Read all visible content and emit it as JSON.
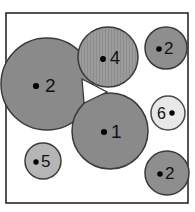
{
  "figure": {
    "background_color": "#ffffff",
    "frame": {
      "x": 6,
      "y": 13,
      "width": 182,
      "height": 190,
      "stroke_color": "#2a2a2a",
      "fill_color": "#ffffff"
    }
  },
  "chart_data": {
    "type": "scatter",
    "title": "",
    "xlabel": "",
    "ylabel": "",
    "grid": false,
    "legend": null,
    "xlim": [
      6,
      188
    ],
    "ylim": [
      13,
      203
    ],
    "categories": [
      "2",
      "4",
      "2",
      "1",
      "6",
      "5",
      "2"
    ],
    "values": [
      46,
      30,
      21,
      38,
      17,
      18,
      22
    ],
    "points": [
      {
        "label": "2",
        "name": "circle-region-left-large",
        "cx": 47,
        "cy": 84,
        "r": 46,
        "fill": "#8a8a8a",
        "stroke": "#3a3a3a",
        "texture": "none",
        "dot_cx": 36,
        "dot_cy": 86,
        "dot_r": 3.1,
        "label_x": 45,
        "label_y": 85,
        "label_anchor": "start",
        "font_size": 19
      },
      {
        "label": "4",
        "name": "circle-region-top-center",
        "cx": 108,
        "cy": 57,
        "r": 30,
        "fill": "#9b9b9b",
        "stroke": "#3a3a3a",
        "texture": "vertical-stripes",
        "dot_cx": 103,
        "dot_cy": 59,
        "dot_r": 2.9,
        "label_x": 110,
        "label_y": 58,
        "label_anchor": "start",
        "font_size": 18
      },
      {
        "label": "2",
        "name": "circle-region-top-right",
        "cx": 166,
        "cy": 48,
        "r": 21,
        "fill": "#8e8e8e",
        "stroke": "#3a3a3a",
        "texture": "none",
        "dot_cx": 159,
        "dot_cy": 49,
        "dot_r": 2.8,
        "label_x": 164,
        "label_y": 48,
        "label_anchor": "start",
        "font_size": 17
      },
      {
        "label": "1",
        "name": "circle-region-center",
        "cx": 110,
        "cy": 131,
        "r": 38,
        "fill": "#8a8a8a",
        "stroke": "#3a3a3a",
        "texture": "none",
        "dot_cx": 104,
        "dot_cy": 132,
        "dot_r": 3.0,
        "label_x": 111,
        "label_y": 131,
        "label_anchor": "start",
        "font_size": 19
      },
      {
        "label": "6",
        "name": "circle-region-right-light",
        "cx": 168,
        "cy": 113,
        "r": 17,
        "fill": "#e8e8e8",
        "stroke": "#4a4a4a",
        "texture": "none",
        "dot_cx": 172,
        "dot_cy": 113,
        "dot_r": 2.7,
        "label_x": 166,
        "label_y": 113,
        "label_anchor": "end",
        "font_size": 16
      },
      {
        "label": "5",
        "name": "circle-region-bottom-left",
        "cx": 43,
        "cy": 161,
        "r": 18,
        "fill": "#b5b5b5",
        "stroke": "#3a3a3a",
        "texture": "none",
        "dot_cx": 36,
        "dot_cy": 162,
        "dot_r": 2.7,
        "label_x": 41,
        "label_y": 161,
        "label_anchor": "start",
        "font_size": 17
      },
      {
        "label": "2",
        "name": "circle-region-bottom-right",
        "cx": 167,
        "cy": 173,
        "r": 22,
        "fill": "#8e8e8e",
        "stroke": "#3a3a3a",
        "texture": "none",
        "dot_cx": 160,
        "dot_cy": 174,
        "dot_r": 2.8,
        "label_x": 165,
        "label_y": 173,
        "label_anchor": "start",
        "font_size": 17
      }
    ],
    "gap_markers": [
      {
        "name": "interstitial-gap-triangle",
        "points": "82,79 107,92 84,103",
        "fill": "#ffffff",
        "stroke": "#3a3a3a"
      }
    ]
  }
}
